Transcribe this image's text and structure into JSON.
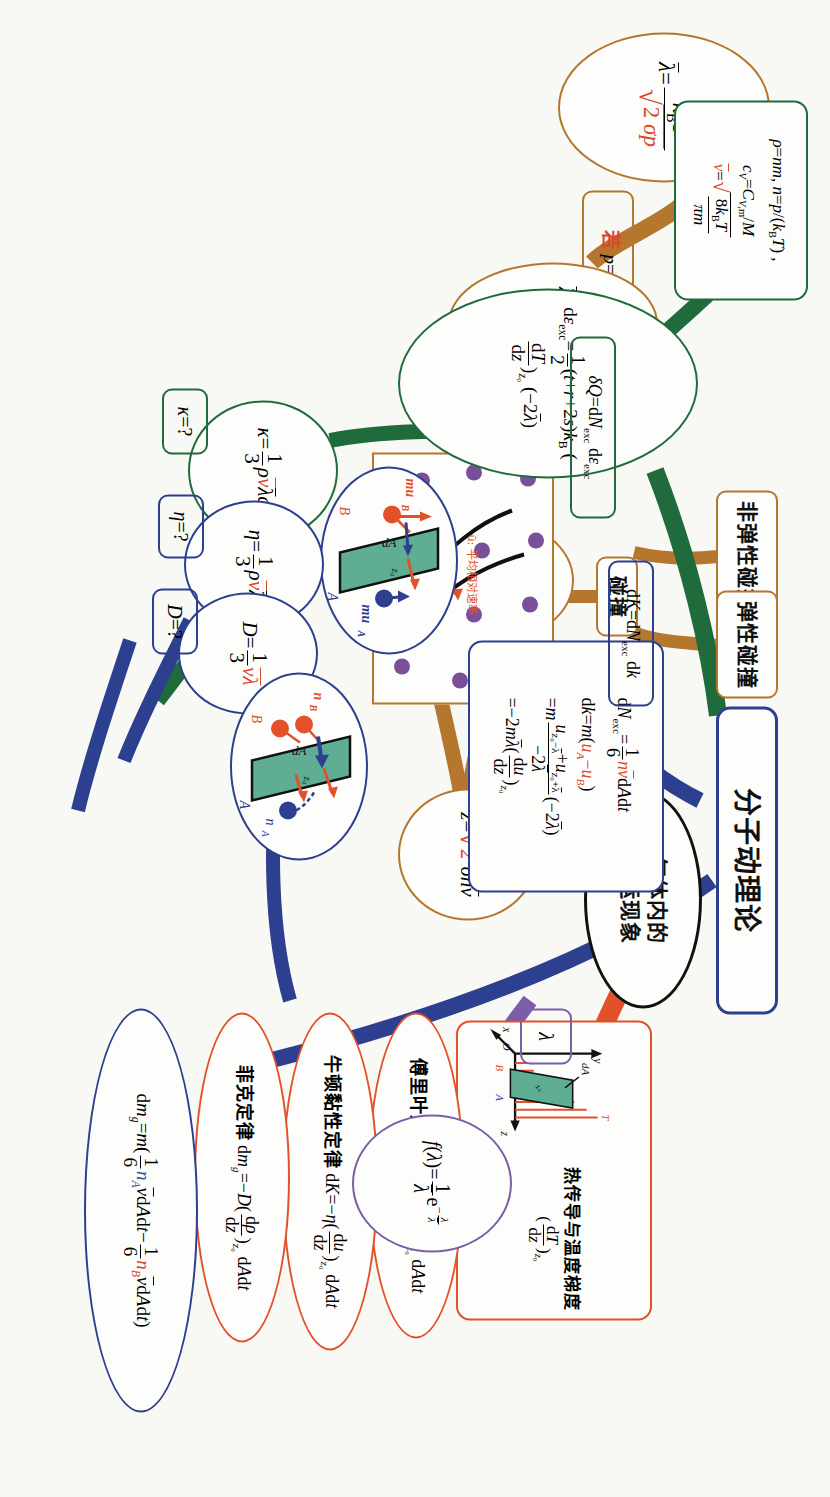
{
  "meta": {
    "orientation_note": "scan rotated 90 degrees",
    "colors": {
      "brown": "#b5762e",
      "green": "#1f6b3b",
      "navy": "#2d3f8f",
      "orange_red": "#e2512a",
      "purple": "#7b5ea7",
      "black": "#111111",
      "plate_green": "#5fae94",
      "molecule_purple": "#7a4f99"
    }
  },
  "nodes": {
    "root": {
      "label": "分子动理论"
    },
    "center": {
      "label": "气体内的输运现象"
    },
    "mfp_p": {
      "label": "λ̄=k_BT/(√2 σp)"
    },
    "mfp_if": {
      "label": "若 p=nk_BT"
    },
    "mfp_n": {
      "label": "λ̄=1/(√2 σn)"
    },
    "z_ratio": {
      "label": "z=v̄/λ̄"
    },
    "z_full": {
      "label": "z=√2 σnv̄"
    },
    "f_lambda": {
      "label": "f(λ)=(1/λ̄)e^(−λ/λ̄)"
    },
    "lambda_small": {
      "label": "λ"
    },
    "collision": {
      "label": "碰撞"
    },
    "elastic": {
      "label": "弹性碰撞"
    },
    "inelastic": {
      "label": "非弹性碰撞"
    },
    "cross_section": {
      "caption": "σ=πd²: 分子散射截面",
      "label_d": "d₁+d₂?",
      "label_2d": "2d",
      "label_u": "ū: 平均相对速率"
    },
    "gas_props": {
      "line1": "ρ=nm, n=p/(k_BT) , c_V=C_{V,m}/M",
      "line2": "v̄=√(8k_BT/πm)"
    },
    "de_exc": {
      "label": "dε_exc = 1/2 (t+r+2s)k_B (dT/dz)_z₀ (−2λ̄)"
    },
    "dQ_exc": {
      "label": "δQ=dN_exc dε_exc"
    },
    "dK_exc": {
      "label": "dK=dN_exc dk"
    },
    "dN_block": {
      "line1": "dN_exc = 1/6 n v̄ dAdt",
      "line2": "dk=m(u_A−u_B)",
      "line3": "=m (u_{z₀−λ̄}+u_{z₀+λ̄})/(−2λ̄) (−2λ̄)",
      "line4": "=−2mλ̄ (du/dz)_z₀"
    },
    "kappa_val": {
      "label": "κ=1/3 ρv̄λ̄c_V"
    },
    "kappa_q": {
      "label": "κ=?"
    },
    "eta_val": {
      "label": "η=1/3 ρv̄λ̄"
    },
    "eta_q": {
      "label": "η=?"
    },
    "D_val": {
      "label": "D=1/3 v̄λ̄"
    },
    "D_q": {
      "label": "D=?"
    },
    "fourier": {
      "label": "傅里叶定律 δQ=−κ (dT/dz)_z₀ dAdt"
    },
    "newton_visc": {
      "label": "牛顿黏性定律 dK=−η (du/dz)_z₀ dAdt"
    },
    "fick": {
      "label": "菲克定律 dm_g=−D (dρ/dz)_z₀ dAdt"
    },
    "dmg": {
      "label": "dm_g=m( 1/6 n_A v̄dAdt − 1/6 n_B v̄dAdt )"
    },
    "heat_fig": {
      "caption": "热传导与温度梯度 (dT/dz)_z₀",
      "axis_x": "x",
      "axis_y": "y",
      "axis_z": "z",
      "axis_o": "O",
      "label_dA": "dA",
      "label_T": "T",
      "label_A": "A",
      "label_B": "B",
      "label_z0": "z₀"
    },
    "momentum_fig": {
      "label_A": "A",
      "label_B": "B",
      "label_muA": "mu_A",
      "label_muB": "mu_B",
      "label_dA": "dA",
      "label_z0": "z₀"
    },
    "density_fig": {
      "label_A": "A",
      "label_B": "B",
      "label_nA": "n_A",
      "label_nB": "n_B",
      "label_dA": "dA",
      "label_z0": "z₀"
    }
  }
}
